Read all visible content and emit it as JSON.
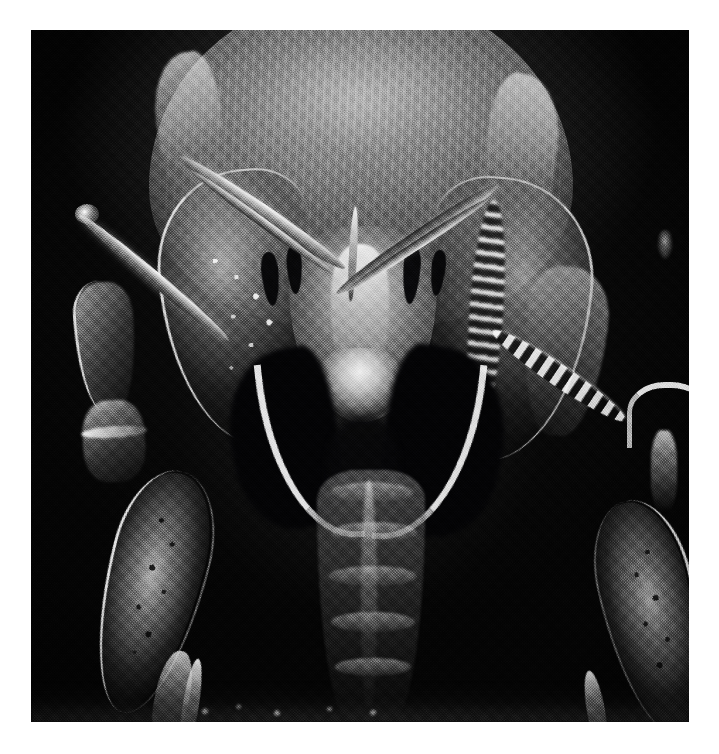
{
  "image": {
    "kind": "scanning-electron-micrograph",
    "subject": "arthropod head and anterior appendages, ventral view",
    "orientation": "anterior up",
    "rendering": "grayscale halftone print",
    "background_color": "#070707",
    "page_color": "#ffffff",
    "highlight_color": "#fefefe",
    "midtone_color": "#808080",
    "shadow_color": "#08080a",
    "plate": {
      "left_px": 31,
      "top_px": 30,
      "width_px": 658,
      "height_px": 692
    },
    "caption": ""
  },
  "anatomy": {
    "carapace": "dorsal shield",
    "carapace_sheen": "specular highlight",
    "carapace_striae": "vertical striation",
    "shoulder_left": "left shoulder ridge",
    "shoulder_right": "right shoulder ridge",
    "rostrum": "clypeus / rostrum",
    "rostrum_ridge": "median ridge",
    "labrum": "labrum",
    "eyes": [
      "left outer eye pit",
      "left inner eye pit",
      "right inner eye pit",
      "right outer eye pit"
    ],
    "palp_left": "left palp",
    "palp_left_inner": "left palp inner segment",
    "palp_right": "right palp",
    "palp_right_inner": "right palp inner segment",
    "median_spine": "median spine",
    "maxilliped_left": "left maxilliped plate",
    "maxilliped_left_punctation": "left plate punctation",
    "maxilliped_right": "right maxilliped plate",
    "maxilliped_right_beads": "right plate beaded margin",
    "hook_left": "left gnathal hook",
    "hook_right": "right gnathal hook",
    "sternum": "sternum / opisthosoma",
    "sternum_keel": "sternal keel",
    "segments": [
      "segment 1",
      "segment 2",
      "segment 3",
      "segment 4",
      "segment 5"
    ],
    "leg_left": {
      "coxa": "left coxa",
      "trochanter": "left trochanter",
      "trochanter_ring": "left trochanter ring",
      "femur": "left femur",
      "femur_punctation": "left femur punctation",
      "tibia": "left tibia",
      "tarsus": "left tarsus",
      "spine": "left lateral spine",
      "spine_tip": "left spine tip"
    },
    "leg_right": {
      "coxa": "right coxa",
      "beaded_bar": "right beaded ridge",
      "claw": "right tarsal claw",
      "claw_stem": "right claw stem",
      "femur": "right femur",
      "femur_punctation": "right femur punctation",
      "tarsus": "right tarsus",
      "fleck": "right background fleck"
    },
    "substrate": "substrate shelf",
    "debris": "substrate debris"
  }
}
